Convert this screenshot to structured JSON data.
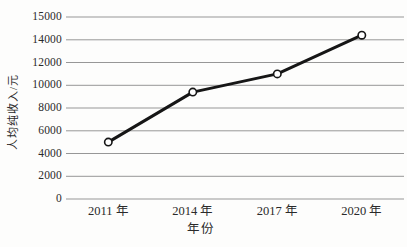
{
  "chart_data": {
    "type": "line",
    "title": "",
    "categories": [
      "2011 年",
      "2014 年",
      "2017 年",
      "2020 年"
    ],
    "series": [
      {
        "name": "人均纯收入",
        "values": [
          5000,
          9400,
          11000,
          14200
        ]
      }
    ],
    "xlabel": "年份",
    "ylabel": "人均纯收入/元",
    "y_ticks": [
      0,
      2000,
      4000,
      6000,
      8000,
      10000,
      12000,
      14000,
      15000
    ],
    "y_tick_labels": [
      "0",
      "2000",
      "4000",
      "6000",
      "8000",
      "10000",
      "12000",
      "14000",
      "15000"
    ],
    "ylim": [
      0,
      15000
    ],
    "grid": "horizontal-only",
    "gridlines_evenly_spaced": true,
    "legend": "none",
    "marker": "open-circle",
    "colors": {
      "line": "#161616",
      "grid": "#979797",
      "text": "#2a2a2a",
      "marker_fill": "#ffffff",
      "background": "#fdfdfc"
    }
  }
}
